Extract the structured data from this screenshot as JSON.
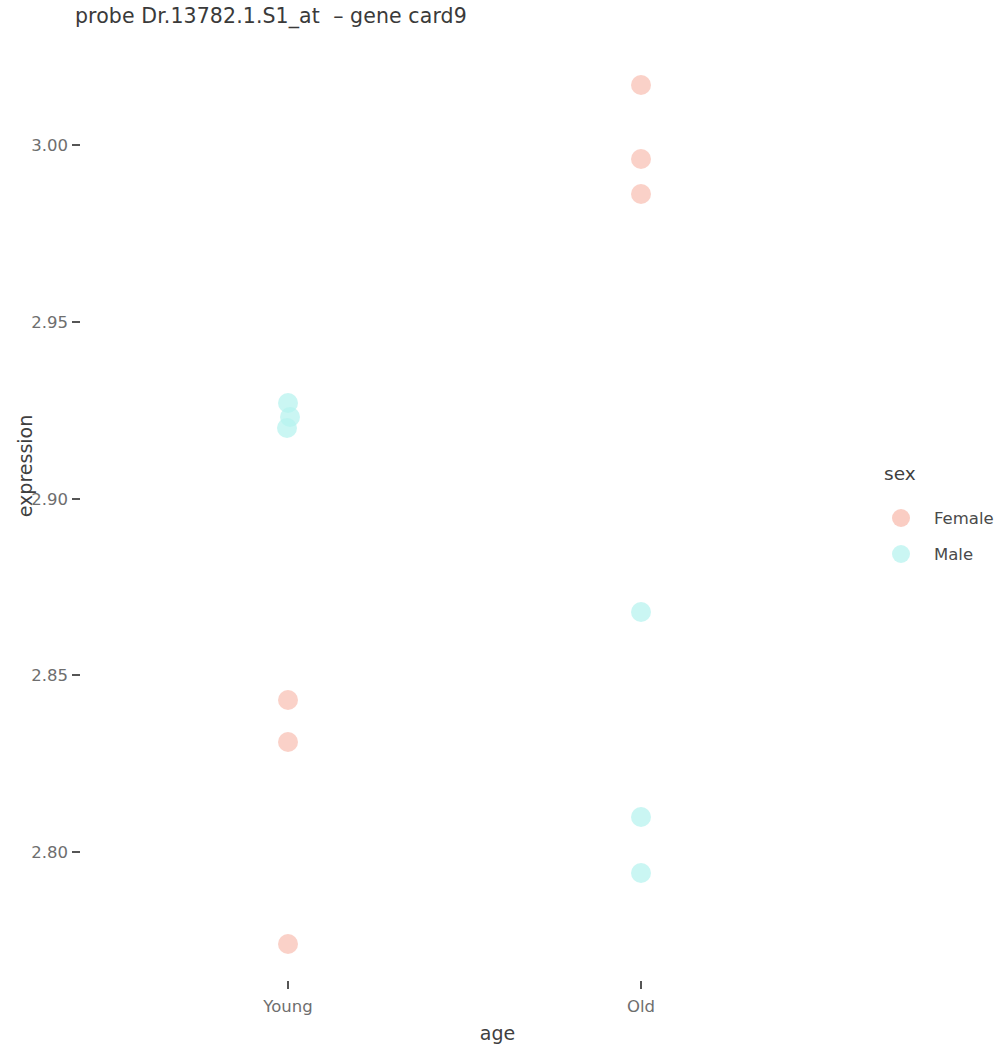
{
  "chart_data": {
    "type": "scatter",
    "title": "probe Dr.13782.1.S1_at  – gene card9",
    "xlabel": "age",
    "ylabel": "expression",
    "categories": [
      "Young",
      "Old"
    ],
    "yticks": [
      "3.00",
      "2.95",
      "2.90",
      "2.85",
      "2.80"
    ],
    "ytick_values": [
      3.0,
      2.95,
      2.9,
      2.85,
      2.8
    ],
    "ylim": [
      2.765,
      3.025
    ],
    "grid": false,
    "legend": {
      "title": "sex",
      "position": "right",
      "entries": [
        {
          "label": "Female",
          "color": "#f9c4b8"
        },
        {
          "label": "Male",
          "color": "#b5f2ee"
        }
      ]
    },
    "series": [
      {
        "name": "Female",
        "color": "#f9c4b8",
        "points": [
          {
            "x": "Old",
            "y": 3.017
          },
          {
            "x": "Old",
            "y": 2.996
          },
          {
            "x": "Old",
            "y": 2.986
          },
          {
            "x": "Young",
            "y": 2.843
          },
          {
            "x": "Young",
            "y": 2.831
          },
          {
            "x": "Young",
            "y": 2.774
          }
        ]
      },
      {
        "name": "Male",
        "color": "#b5f2ee",
        "points": [
          {
            "x": "Young",
            "y": 2.927
          },
          {
            "x": "Young",
            "y": 2.923
          },
          {
            "x": "Young",
            "y": 2.92
          },
          {
            "x": "Old",
            "y": 2.868
          },
          {
            "x": "Old",
            "y": 2.81
          },
          {
            "x": "Old",
            "y": 2.794
          }
        ]
      }
    ]
  },
  "layout": {
    "x_positions": {
      "Young": 288,
      "Old": 641
    },
    "y_axis_pixels": {
      "value_top": 3.0,
      "pixel_top": 145,
      "value_bottom": 2.8,
      "pixel_bottom": 852
    },
    "tick_label_x": 68,
    "tick_mark_x": 72,
    "point_jitter": [
      {
        "series": "Female",
        "index": 0,
        "dx": 0,
        "dy": 0
      },
      {
        "series": "Female",
        "index": 1,
        "dx": 0,
        "dy": 0
      },
      {
        "series": "Female",
        "index": 2,
        "dx": 0,
        "dy": 0
      },
      {
        "series": "Female",
        "index": 3,
        "dx": 0,
        "dy": 0
      },
      {
        "series": "Female",
        "index": 4,
        "dx": 0,
        "dy": 0
      },
      {
        "series": "Female",
        "index": 5,
        "dx": 0,
        "dy": 0
      },
      {
        "series": "Male",
        "index": 0,
        "dx": 0,
        "dy": 0
      },
      {
        "series": "Male",
        "index": 1,
        "dx": 2,
        "dy": 0
      },
      {
        "series": "Male",
        "index": 2,
        "dx": -1,
        "dy": 0
      },
      {
        "series": "Male",
        "index": 3,
        "dx": 0,
        "dy": 0
      },
      {
        "series": "Male",
        "index": 4,
        "dx": 0,
        "dy": 0
      },
      {
        "series": "Male",
        "index": 5,
        "dx": 0,
        "dy": 0
      }
    ]
  }
}
